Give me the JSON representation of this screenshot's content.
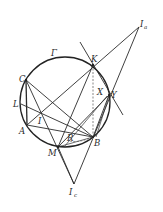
{
  "figure": {
    "circle": {
      "label": "Γ",
      "cx": 65,
      "cy": 102,
      "r": 45
    },
    "points": {
      "Ia": {
        "label": "I",
        "sub": "a",
        "x": 139,
        "y": 27
      },
      "K": {
        "label": "K",
        "x": 93,
        "y": 65
      },
      "C": {
        "label": "C",
        "x": 26,
        "y": 80
      },
      "L": {
        "label": "L",
        "x": 21,
        "y": 104
      },
      "I": {
        "label": "I",
        "x": 41,
        "y": 112
      },
      "A": {
        "label": "A",
        "x": 27,
        "y": 125
      },
      "X": {
        "label": "X",
        "x": 104,
        "y": 94
      },
      "Y": {
        "label": "Y",
        "x": 109,
        "y": 95
      },
      "R": {
        "label": "R",
        "x": 72,
        "y": 138
      },
      "B": {
        "label": "B",
        "x": 93,
        "y": 137
      },
      "M": {
        "label": "M",
        "x": 58,
        "y": 147
      },
      "Ic": {
        "label": "I",
        "sub": "c",
        "x": 74,
        "y": 184
      }
    },
    "labels": {
      "gamma": "Γ",
      "Ia_main": "I",
      "Ia_sub": "a",
      "K": "K",
      "C": "C",
      "L": "L",
      "I": "I",
      "A": "A",
      "X": "X",
      "Y": "Y",
      "R": "R",
      "B": "B",
      "M": "M",
      "Ic_main": "I",
      "Ic_sub": "c"
    }
  }
}
